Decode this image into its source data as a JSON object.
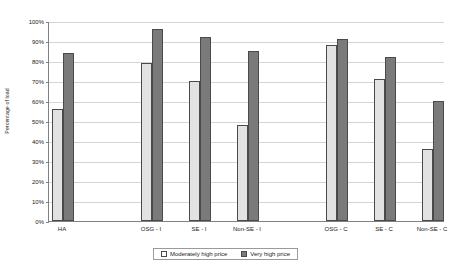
{
  "chart_data": {
    "type": "bar",
    "title": "",
    "xlabel": "",
    "ylabel": "Percentage of load",
    "ylim": [
      0,
      100
    ],
    "ytick_labels": [
      "0%",
      "10%",
      "20%",
      "30%",
      "40%",
      "50%",
      "60%",
      "70%",
      "80%",
      "90%",
      "100%"
    ],
    "ytick_values": [
      0,
      10,
      20,
      30,
      40,
      50,
      60,
      70,
      80,
      90,
      100
    ],
    "grid": true,
    "legend_position": "bottom-center",
    "categories": [
      "HA",
      "OSG - I",
      "SE - I",
      "Non-SE - I",
      "OSG - C",
      "SE - C",
      "Non-SE - C"
    ],
    "series": [
      {
        "name": "Moderately high price",
        "color": "#e2e2e2",
        "values": [
          56,
          79,
          70,
          48,
          88,
          71,
          36
        ]
      },
      {
        "name": "Very high price",
        "color": "#7a7a7a",
        "values": [
          84,
          96,
          92,
          85,
          91,
          82,
          60
        ]
      }
    ]
  },
  "legend": {
    "items": [
      {
        "label": "Moderately high price",
        "swatch": "light-swatch-icon"
      },
      {
        "label": "Very high price",
        "swatch": "dark-swatch-icon"
      }
    ]
  }
}
